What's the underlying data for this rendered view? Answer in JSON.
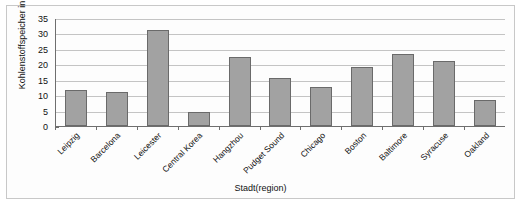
{
  "chart_data": {
    "type": "bar",
    "title": "",
    "xlabel": "Stadt(region)",
    "ylabel": "Kohlenstoffspeicher in tC/ha",
    "categories": [
      "Leipzig",
      "Barcelona",
      "Leicester",
      "Central Korea",
      "Hangzhou",
      "Pudget Sound",
      "Chicago",
      "Boston",
      "Baltimore",
      "Syracuse",
      "Oakland"
    ],
    "values": [
      11.8,
      11.0,
      31.0,
      4.5,
      22.5,
      15.5,
      12.5,
      19.0,
      23.3,
      21.0,
      8.3
    ],
    "ylim": [
      0,
      35
    ],
    "yticks": [
      "0",
      "5",
      "10",
      "15",
      "20",
      "25",
      "30",
      "35"
    ],
    "grid": true,
    "legend": "none",
    "bar_color": "#a2a2a2",
    "bar_border_color": "#6a6a6a",
    "axis_color": "#6e6e6e",
    "gridline_color": "#c4c4c4"
  }
}
